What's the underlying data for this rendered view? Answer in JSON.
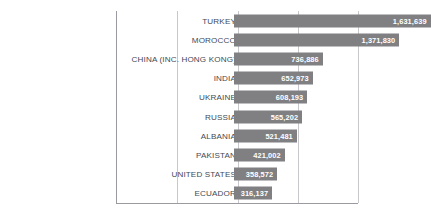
{
  "chart_data": {
    "type": "bar",
    "orientation": "horizontal",
    "title": "",
    "subtitle": "",
    "xlabel": "",
    "ylabel": "",
    "grid": true,
    "legend": false,
    "xlim": [
      0,
      2000000
    ],
    "gridline_values": [
      500000,
      1000000,
      1500000,
      2000000
    ],
    "categories": [
      "TURKEY",
      "MOROCCO",
      "CHINA (INC. HONG KONG)",
      "INDIA",
      "UKRAINE",
      "RUSSIA",
      "ALBANIA",
      "PAKISTAN",
      "UNITED STATES",
      "ECUADOR"
    ],
    "values": [
      1631639,
      1371830,
      736886,
      652973,
      608193,
      565202,
      521481,
      421002,
      358572,
      316137
    ],
    "value_labels": [
      "1,631,639",
      "1,371,830",
      "736,886",
      "652,973",
      "608,193",
      "565,202",
      "521,481",
      "421,002",
      "358,572",
      "316,137"
    ],
    "colors": {
      "bar": "#808083",
      "value_label": "#ffffff",
      "category_label": "#3f4a56",
      "gridline": "#c8c8cc",
      "axis": "#9a9aa0",
      "background": "#ffffff"
    }
  }
}
